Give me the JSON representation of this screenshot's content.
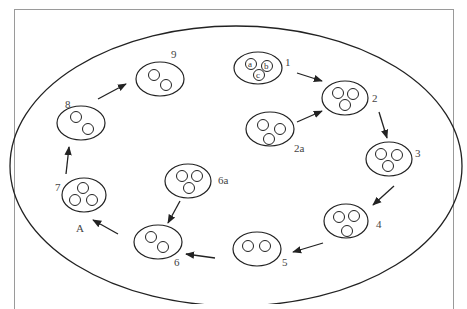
{
  "diagram": {
    "type": "cell-cycle-diagram",
    "stages": [
      {
        "id": "1",
        "label": "1",
        "cells": 3,
        "cell_labels": [
          "a",
          "b",
          "c"
        ]
      },
      {
        "id": "2",
        "label": "2",
        "cells": 3
      },
      {
        "id": "2a",
        "label": "2a",
        "cells": 3
      },
      {
        "id": "3",
        "label": "3",
        "cells": 3
      },
      {
        "id": "4",
        "label": "4",
        "cells": 3
      },
      {
        "id": "5",
        "label": "5",
        "cells": 2
      },
      {
        "id": "6",
        "label": "6",
        "cells": 2
      },
      {
        "id": "6a",
        "label": "6a",
        "cells": 3
      },
      {
        "id": "7",
        "label": "7",
        "cells": 3
      },
      {
        "id": "8",
        "label": "8",
        "cells": 2
      },
      {
        "id": "9",
        "label": "9",
        "cells": 2
      }
    ],
    "arrows": [
      [
        "1",
        "2"
      ],
      [
        "2a",
        "2"
      ],
      [
        "2",
        "3"
      ],
      [
        "3",
        "4"
      ],
      [
        "4",
        "5"
      ],
      [
        "5",
        "6"
      ],
      [
        "6a",
        "6"
      ],
      [
        "6",
        "7"
      ],
      [
        "7",
        "8"
      ],
      [
        "8",
        "9"
      ]
    ],
    "annotation": "A",
    "colors": {
      "stroke": "#222222",
      "label": "#444444",
      "frame": "#9a9a9a"
    }
  }
}
